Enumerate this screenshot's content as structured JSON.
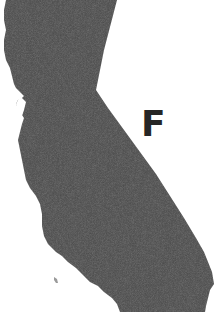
{
  "figure": {
    "label": "F",
    "colors": {
      "fill": "#4a4a4a",
      "label": "#262626",
      "background": "#ffffff"
    }
  }
}
